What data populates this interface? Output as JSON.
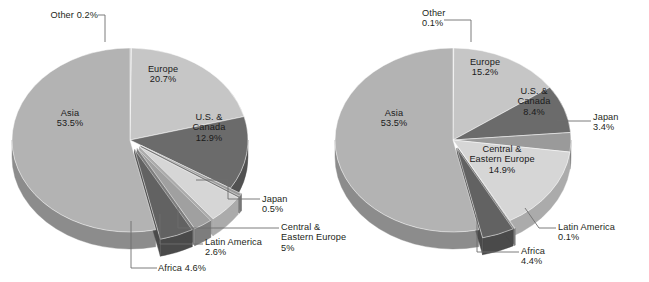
{
  "figure": {
    "type": "two-pie-panel",
    "background": "#ffffff",
    "text_color": "#231f20",
    "leader_color": "#6e6e6e"
  },
  "palette": {
    "asia": "#b3b3b3",
    "asia_side": "#8c8c8c",
    "europe": "#c6c6c6",
    "europe_side": "#9d9d9d",
    "us_canada": "#6b6b6b",
    "us_canada_side": "#515151",
    "japan": "#9a9a9a",
    "japan_side": "#787878",
    "cee": "#d6d6d6",
    "cee_side": "#ababab",
    "latin": "#a0a0a0",
    "latin_side": "#7d7d7d",
    "africa": "#626262",
    "africa_side": "#4a4a4a",
    "other": "#bdbdbd",
    "other_side": "#949494"
  },
  "chart_data": [
    {
      "id": "left",
      "type": "pie",
      "title": "",
      "three_d": true,
      "exploded": [
        "Africa",
        "Latin America",
        "Central & Eastern Europe",
        "Japan"
      ],
      "categories": [
        "Other",
        "Europe",
        "U.S. & Canada",
        "Japan",
        "Central & Eastern Europe",
        "Latin America",
        "Africa",
        "Asia"
      ],
      "values": [
        0.2,
        20.7,
        12.9,
        0.5,
        5.0,
        2.6,
        4.6,
        53.5
      ],
      "labels": [
        {
          "name": "Other",
          "value": "0.2%",
          "text": "Other 0.2%",
          "placement": "external"
        },
        {
          "name": "Europe",
          "value": "20.7%",
          "text": "Europe\n20.7%",
          "placement": "internal"
        },
        {
          "name": "U.S. &\nCanada",
          "value": "12.9%",
          "text": "U.S. &\nCanada\n12.9%",
          "placement": "internal"
        },
        {
          "name": "Japan",
          "value": "0.5%",
          "text": "Japan\n0.5%",
          "placement": "external"
        },
        {
          "name": "Central &\nEastern Europe",
          "value": "5%",
          "text": "Central &\nEastern Europe\n5%",
          "placement": "external"
        },
        {
          "name": "Latin America",
          "value": "2.6%",
          "text": "Latin America\n2.6%",
          "placement": "external"
        },
        {
          "name": "Africa",
          "value": "4.6%",
          "text": "Africa 4.6%",
          "placement": "external"
        },
        {
          "name": "Asia",
          "value": "53.5%",
          "text": "Asia\n53.5%",
          "placement": "internal"
        }
      ]
    },
    {
      "id": "right",
      "type": "pie",
      "title": "",
      "three_d": true,
      "exploded": [
        "Africa",
        "Latin America"
      ],
      "categories": [
        "Other",
        "Europe",
        "U.S. & Canada",
        "Japan",
        "Central & Eastern Europe",
        "Latin America",
        "Africa",
        "Asia"
      ],
      "values": [
        0.1,
        15.2,
        8.4,
        3.4,
        14.9,
        0.1,
        4.4,
        53.5
      ],
      "labels": [
        {
          "name": "Other",
          "value": "0.1%",
          "text": "Other\n0.1%",
          "placement": "external"
        },
        {
          "name": "Europe",
          "value": "15.2%",
          "text": "Europe\n15.2%",
          "placement": "internal"
        },
        {
          "name": "U.S. &\nCanada",
          "value": "8.4%",
          "text": "U.S. &\nCanada\n8.4%",
          "placement": "internal"
        },
        {
          "name": "Japan",
          "value": "3.4%",
          "text": "Japan\n3.4%",
          "placement": "external"
        },
        {
          "name": "Central &\nEastern Europe",
          "value": "14.9%",
          "text": "Central &\nEastern Europe\n14.9%",
          "placement": "internal"
        },
        {
          "name": "Latin America",
          "value": "0.1%",
          "text": "Latin America\n0.1%",
          "placement": "external"
        },
        {
          "name": "Africa",
          "value": "4.4%",
          "text": "Africa\n4.4%",
          "placement": "external"
        },
        {
          "name": "Asia",
          "value": "53.5%",
          "text": "Asia\n53.5%",
          "placement": "internal"
        }
      ]
    }
  ],
  "left_labels": {
    "other": "Other 0.2%",
    "europe_name": "Europe",
    "europe_val": "20.7%",
    "usca_l1": "U.S. &",
    "usca_l2": "Canada",
    "usca_val": "12.9%",
    "asia_name": "Asia",
    "asia_val": "53.5%",
    "japan_name": "Japan",
    "japan_val": "0.5%",
    "cee_l1": "Central &",
    "cee_l2": "Eastern Europe",
    "cee_val": "5%",
    "latin_name": "Latin America",
    "latin_val": "2.6%",
    "africa": "Africa 4.6%"
  },
  "right_labels": {
    "other_name": "Other",
    "other_val": "0.1%",
    "europe_name": "Europe",
    "europe_val": "15.2%",
    "usca_l1": "U.S. &",
    "usca_l2": "Canada",
    "usca_val": "8.4%",
    "asia_name": "Asia",
    "asia_val": "53.5%",
    "japan_name": "Japan",
    "japan_val": "3.4%",
    "cee_l1": "Central &",
    "cee_l2": "Eastern Europe",
    "cee_val": "14.9%",
    "latin_name": "Latin America",
    "latin_val": "0.1%",
    "africa_name": "Africa",
    "africa_val": "4.4%"
  }
}
